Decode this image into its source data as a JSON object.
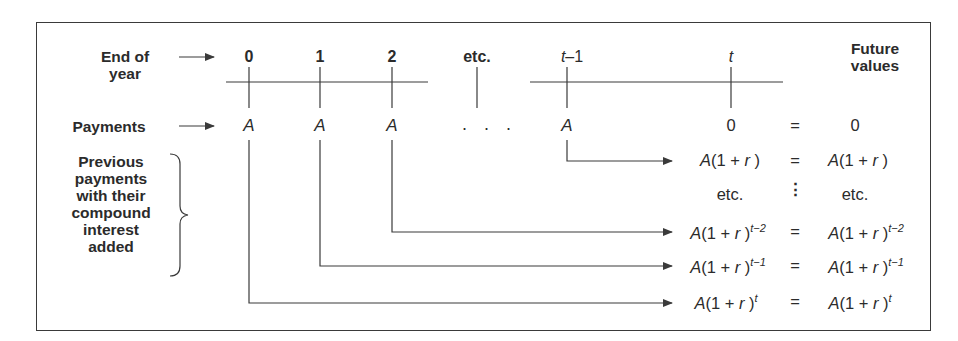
{
  "row_labels": {
    "end_of_year_line1": "End of",
    "end_of_year_line2": "year",
    "payments": "Payments",
    "previous_lines": [
      "Previous",
      "payments",
      "with their",
      "compound",
      "interest",
      "added"
    ],
    "future_line1": "Future",
    "future_line2": "values"
  },
  "timeline": {
    "ticks": [
      {
        "label": "0",
        "italic": false
      },
      {
        "label": "1",
        "italic": false
      },
      {
        "label": "2",
        "italic": false
      },
      {
        "label": "etc.",
        "italic": false
      },
      {
        "label": "t",
        "suffix": "–1",
        "italic": true
      },
      {
        "label": "t",
        "italic": true
      }
    ]
  },
  "payments": {
    "values": [
      "A",
      "A",
      "A",
      ". . .",
      "A",
      "0"
    ]
  },
  "future_values": [
    {
      "left": "0",
      "eq": "=",
      "right": "0"
    },
    {
      "left_base": "A(1 + ",
      "left_var": "r",
      "left_close": ")",
      "left_exp": "",
      "eq": "=",
      "right_base": "A(1 + ",
      "right_var": "r",
      "right_close": ")",
      "right_exp": ""
    },
    {
      "left": "etc.",
      "eq": "⋮",
      "right": "etc."
    },
    {
      "left_base": "A(1 + ",
      "left_var": "r",
      "left_close": ")",
      "left_exp": "t−2",
      "eq": "=",
      "right_base": "A(1 + ",
      "right_var": "r",
      "right_close": ")",
      "right_exp": "t−2"
    },
    {
      "left_base": "A(1 + ",
      "left_var": "r",
      "left_close": ")",
      "left_exp": "t−1",
      "eq": "=",
      "right_base": "A(1 + ",
      "right_var": "r",
      "right_close": ")",
      "right_exp": "t−1"
    },
    {
      "left_base": "A(1 + ",
      "left_var": "r",
      "left_close": ")",
      "left_exp": "t",
      "eq": "=",
      "right_base": "A(1 + ",
      "right_var": "r",
      "right_close": ")",
      "right_exp": "t"
    }
  ],
  "colors": {
    "line": "#3a3a3a",
    "text": "#2b2b2b",
    "background": "#ffffff"
  }
}
